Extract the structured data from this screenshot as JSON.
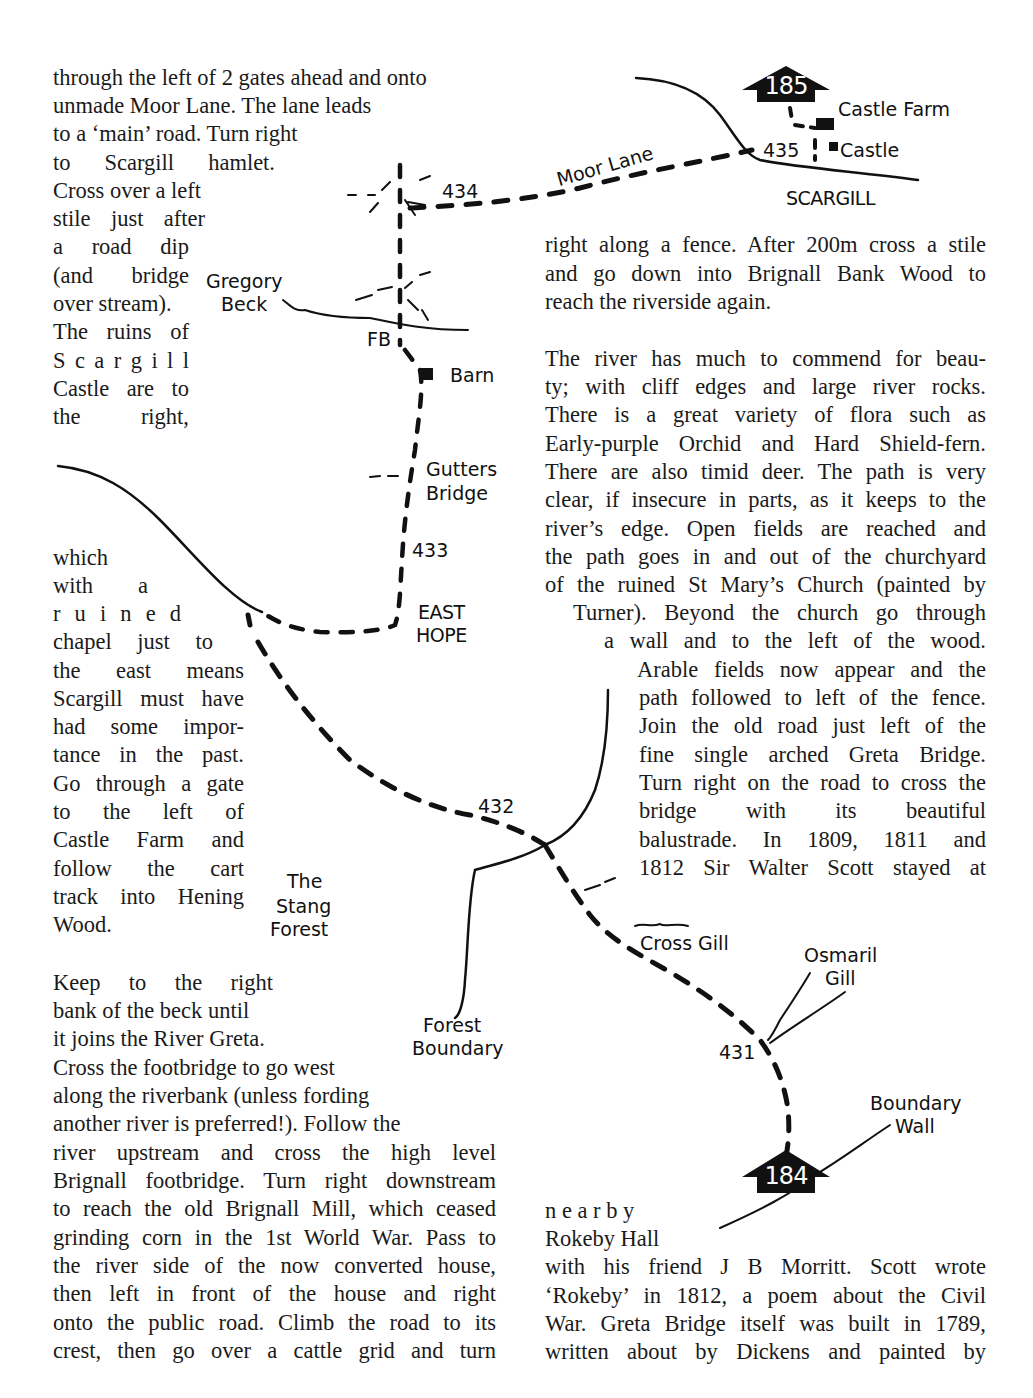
{
  "page": {
    "left_column": {
      "para1_lines": [
        "through the left of 2 gates ahead and onto",
        "unmade Moor Lane.  The lane leads",
        "to a ‘main’ road.  Turn right",
        "to  Scargill  hamlet.",
        "Cross over a left",
        "stile just after",
        "a road dip",
        "(and bridge",
        "over stream).",
        "The ruins of",
        "S c a r g i l l",
        "Castle are to",
        "the      right,",
        "which",
        "with     a",
        "r u i n e d",
        "chapel just to",
        "the east means",
        "Scargill must have",
        "had some impor-",
        "tance in the past.",
        "Go through a gate",
        "to the left of",
        "Castle Farm and",
        "follow the cart",
        "track into Hening",
        "Wood."
      ],
      "para2_lines": [
        "Keep  to  the  right",
        "bank of the beck until",
        "it joins the River Greta.",
        "Cross the footbridge to go west",
        "along the riverbank (unless fording",
        "another river is preferred!).  Follow the",
        "river upstream and cross the high level",
        "Brignall footbridge.  Turn right downstream",
        "to reach the old Brignall Mill, which ceased",
        "grinding corn in the 1st World War.  Pass to",
        "the river side of the now converted house,",
        "then left in front of the house and right",
        "onto the public road.  Climb the road to its",
        "crest, then go over a cattle grid and turn"
      ]
    },
    "right_column": {
      "para1_lines": [
        "right along a fence.  After 200m cross a stile",
        "and go down into Brignall Bank Wood to",
        "reach the riverside again."
      ],
      "para2_lines": [
        "The river has much to commend for beau-",
        "ty; with cliff edges and large river rocks.",
        "There is a great variety of flora such as",
        "Early-purple Orchid and Hard Shield-fern.",
        "There are also timid deer.  The path is very",
        "clear, if insecure in parts, as it keeps to the",
        "river’s edge.  Open fields are reached and",
        "the path goes in and out of the churchyard",
        "of the ruined St Mary’s Church (painted by",
        "Turner).  Beyond the church go through",
        "a wall and to the left of the wood.",
        "Arable fields now appear and the",
        "path followed to left of the fence.",
        "Join the old road just left of the",
        "fine single arched Greta Bridge.",
        "Turn right on the road to cross the",
        "bridge with its beautiful",
        "balustrade.  In 1809, 1811 and",
        "1812 Sir Walter Scott stayed at"
      ],
      "para3_lines": [
        "n e a r b y",
        "Rokeby  Hall",
        "with his friend J B Morritt.  Scott wrote",
        "‘Rokeby’ in 1812, a poem about the Civil",
        "War.  Greta Bridge itself was built in 1789,",
        "written about by Dickens and painted by"
      ]
    },
    "map": {
      "waypoints": [
        "435",
        "434",
        "433",
        "432",
        "431"
      ],
      "arrows": {
        "top": "185",
        "bottom": "184"
      },
      "labels": {
        "castle_farm": "Castle Farm",
        "castle": "Castle",
        "scargill": "SCARGILL",
        "moor_lane": "Moor Lane",
        "gregory": "Gregory",
        "beck": "Beck",
        "fb": "FB",
        "barn": "Barn",
        "gutters": "Gutters",
        "bridge": "Bridge",
        "east": "EAST",
        "hope": "HOPE",
        "the": "The",
        "stang": "Stang",
        "forest": "Forest",
        "forest2": "Forest",
        "boundary": "Boundary",
        "cross_gill": "Cross Gill",
        "osmaril": "Osmaril",
        "gill": "Gill",
        "boundary2": "Boundary",
        "wall": "Wall"
      }
    }
  }
}
